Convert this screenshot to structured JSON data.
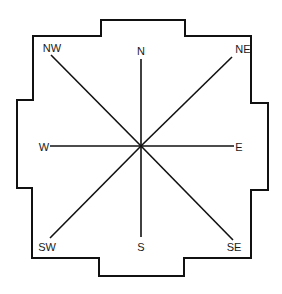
{
  "diagram": {
    "colors": {
      "background": "#ffffff",
      "stroke": "#111111",
      "text": "#1a1a1a"
    },
    "center": {
      "x": 141,
      "y": 146
    },
    "outline_points": "101,20 185,20 185,36 251,36 251,103 268,103 268,190 251,190 251,258 184,258 184,276 99,276 99,258 32,258 32,188 17,188 17,100 33,100 33,36 101,36",
    "directions": [
      {
        "id": "n",
        "label": "N",
        "label_x": 141,
        "label_y": 55,
        "anchor": "middle",
        "line_x": 141,
        "line_y": 59
      },
      {
        "id": "ne",
        "label": "NE",
        "label_x": 243,
        "label_y": 53,
        "anchor": "middle",
        "line_x": 232,
        "line_y": 57
      },
      {
        "id": "e",
        "label": "E",
        "label_x": 239,
        "label_y": 151,
        "anchor": "middle",
        "line_x": 234,
        "line_y": 146
      },
      {
        "id": "se",
        "label": "SE",
        "label_x": 234,
        "label_y": 251,
        "anchor": "middle",
        "line_x": 233,
        "line_y": 240
      },
      {
        "id": "s",
        "label": "S",
        "label_x": 141,
        "label_y": 251,
        "anchor": "middle",
        "line_x": 141,
        "line_y": 237
      },
      {
        "id": "sw",
        "label": "SW",
        "label_x": 47,
        "label_y": 251,
        "anchor": "middle",
        "line_x": 50,
        "line_y": 238
      },
      {
        "id": "w",
        "label": "W",
        "label_x": 44,
        "label_y": 151,
        "anchor": "middle",
        "line_x": 50,
        "line_y": 146
      },
      {
        "id": "nw",
        "label": "NW",
        "label_x": 52,
        "label_y": 52,
        "anchor": "middle",
        "line_x": 51,
        "line_y": 55
      }
    ]
  }
}
